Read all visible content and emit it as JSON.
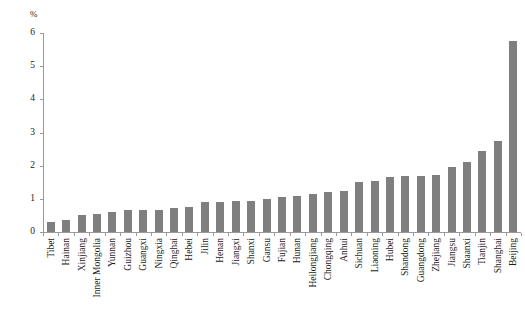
{
  "chart_data": {
    "type": "bar",
    "title": "",
    "subtitle": "",
    "xlabel": "",
    "ylabel": "%",
    "ylim": [
      0,
      6
    ],
    "yticks": [
      0,
      1,
      2,
      3,
      4,
      5,
      6
    ],
    "ytick_labels": [
      "0",
      "1",
      "2",
      "3",
      "4",
      "5",
      "6"
    ],
    "grid": false,
    "legend": null,
    "bar_color": "#7f7f7f",
    "axis_color": "#9a9a9a",
    "categories": [
      "Tibet",
      "Hainan",
      "Xinjiang",
      "Inner Mongolia",
      "Yunnan",
      "Guizhou",
      "Guangxi",
      "Ningxia",
      "Qinghai",
      "Hebei",
      "Jilin",
      "Henan",
      "Jiangxi",
      "Shanxi",
      "Gansu",
      "Fujian",
      "Hunan",
      "Heilongjiang",
      "Chongqing",
      "Anhui",
      "Sichuan",
      "Liaoning",
      "Hubei",
      "Shandong",
      "Guangdong",
      "Zhejiang",
      "Jiangsu",
      "Shaanxi",
      "Tianjin",
      "Shanghai",
      "Beijing"
    ],
    "values": [
      0.3,
      0.35,
      0.5,
      0.55,
      0.6,
      0.65,
      0.65,
      0.67,
      0.72,
      0.75,
      0.9,
      0.92,
      0.93,
      0.95,
      1.0,
      1.05,
      1.1,
      1.15,
      1.2,
      1.25,
      1.5,
      1.55,
      1.65,
      1.7,
      1.7,
      1.72,
      1.95,
      2.1,
      2.45,
      2.75,
      5.75
    ]
  }
}
